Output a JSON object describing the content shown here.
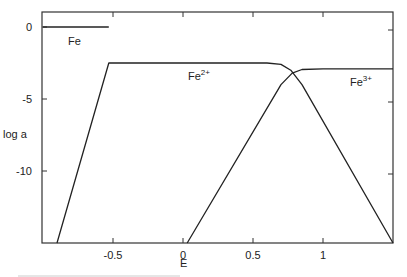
{
  "chart_data": {
    "type": "line",
    "title": "",
    "xlabel": "E",
    "ylabel": "log a",
    "xlim": [
      -1.0,
      1.5
    ],
    "ylim": [
      -15,
      1
    ],
    "x_ticks": [
      {
        "value": -0.5,
        "label": "-0.5"
      },
      {
        "value": 0,
        "label": "0"
      },
      {
        "value": 0.5,
        "label": "0.5"
      },
      {
        "value": 1,
        "label": "1"
      }
    ],
    "y_ticks": [
      {
        "value": 0,
        "label": "0"
      },
      {
        "value": -5,
        "label": "-5"
      },
      {
        "value": -10,
        "label": "-10"
      }
    ],
    "grid": false,
    "legend": "none (inline labels)",
    "series": [
      {
        "name": "Fe",
        "label_base": "Fe",
        "label_sup": "",
        "points": [
          [
            -1.0,
            0
          ],
          [
            -0.53,
            0
          ]
        ]
      },
      {
        "name": "Fe2+",
        "label_base": "Fe",
        "label_sup": "2+",
        "points": [
          [
            -0.9,
            -15
          ],
          [
            -0.53,
            -2.5
          ],
          [
            0.6,
            -2.5
          ],
          [
            0.7,
            -2.6
          ],
          [
            0.77,
            -3.0
          ],
          [
            0.85,
            -4.0
          ],
          [
            1.5,
            -15
          ]
        ]
      },
      {
        "name": "Fe3+",
        "label_base": "Fe",
        "label_sup": "3+",
        "points": [
          [
            0.03,
            -15
          ],
          [
            0.7,
            -4.0
          ],
          [
            0.78,
            -3.2
          ],
          [
            0.85,
            -2.95
          ],
          [
            1.0,
            -2.9
          ],
          [
            1.5,
            -2.9
          ]
        ]
      }
    ]
  }
}
